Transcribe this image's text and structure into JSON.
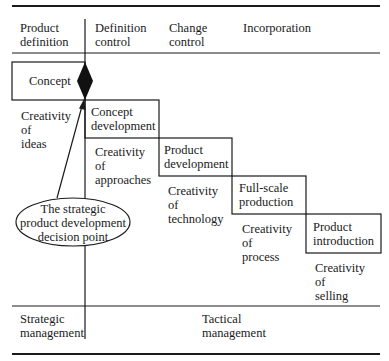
{
  "header": {
    "columns": [
      {
        "label": "Product\ndefinition"
      },
      {
        "label": "Definition\ncontrol"
      },
      {
        "label": "Change\ncontrol"
      },
      {
        "label": "Incorporation"
      }
    ]
  },
  "stages": [
    {
      "label": "Concept",
      "creativity": "Creativity\nof\nideas"
    },
    {
      "label": "Concept\ndevelopment",
      "creativity": "Creativity\nof\napproaches"
    },
    {
      "label": "Product\ndevelopment",
      "creativity": "Creativity\nof\ntechnology"
    },
    {
      "label": "Full-scale\nproduction",
      "creativity": "Creativity\nof\nprocess"
    },
    {
      "label": "Product\nintroduction",
      "creativity": "Creativity\nof\nselling"
    }
  ],
  "decision_point": {
    "label": "The strategic\nproduct development\ndecision point"
  },
  "footer": {
    "strategic": "Strategic\nmanagement",
    "tactical": "Tactical\nmanagement"
  }
}
